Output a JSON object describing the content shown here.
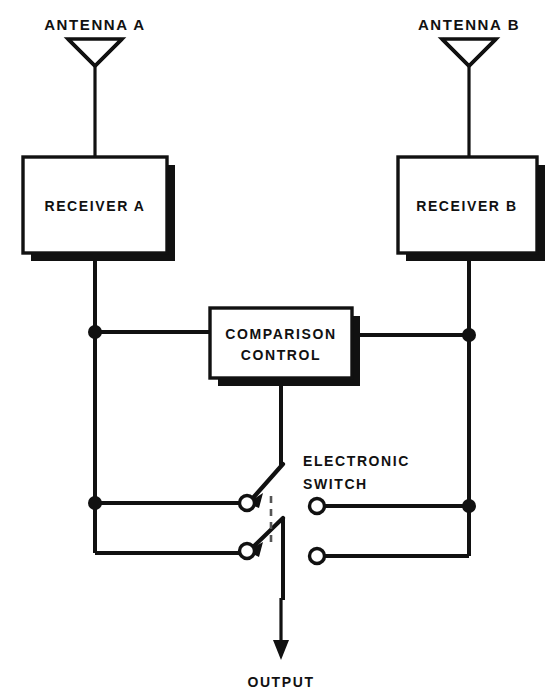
{
  "diagram": {
    "colors": {
      "ink": "#111111",
      "paper": "#ffffff",
      "dashed": "#555555"
    },
    "antennas": [
      {
        "id": "antenna-a",
        "label": "ANTENNA A",
        "x": 95,
        "label_x": 95,
        "label_y": 30
      },
      {
        "id": "antenna-b",
        "label": "ANTENNA B",
        "x": 469,
        "label_x": 469,
        "label_y": 30
      }
    ],
    "receivers": [
      {
        "id": "receiver-a",
        "label": "RECEIVER A",
        "x": 23,
        "y": 157,
        "w": 144,
        "h": 96
      },
      {
        "id": "receiver-b",
        "label": "RECEIVER B",
        "x": 398,
        "y": 157,
        "w": 139,
        "h": 96
      }
    ],
    "comparison_control": {
      "id": "comparison-control",
      "label_line1": "COMPARISON",
      "label_line2": "CONTROL",
      "x": 210,
      "y": 308,
      "w": 142,
      "h": 70
    },
    "electronic_switch": {
      "id": "electronic-switch",
      "label_line1": "ELECTRONIC",
      "label_line2": "SWITCH",
      "label_x": 303,
      "label_y1": 466,
      "label_y2": 489,
      "terminals": [
        {
          "id": "switch-terminal-left-upper",
          "cx": 247,
          "cy": 503,
          "r": 7.5
        },
        {
          "id": "switch-terminal-left-lower",
          "cx": 247,
          "cy": 551,
          "r": 7.5
        },
        {
          "id": "switch-terminal-right-upper",
          "cx": 317,
          "cy": 506,
          "r": 7.5
        },
        {
          "id": "switch-terminal-right-lower",
          "cx": 317,
          "cy": 556,
          "r": 7.5
        }
      ]
    },
    "output": {
      "id": "output",
      "label": "OUTPUT",
      "label_x": 281,
      "label_y": 684,
      "arrow_x": 281,
      "arrow_tip_y": 658
    },
    "junctions": [
      {
        "id": "junction-left-upper",
        "cx": 95,
        "cy": 332,
        "r": 7
      },
      {
        "id": "junction-left-lower",
        "cx": 95,
        "cy": 503,
        "r": 7
      },
      {
        "id": "junction-right-upper",
        "cx": 469,
        "cy": 335,
        "r": 7
      },
      {
        "id": "junction-right-lower",
        "cx": 469,
        "cy": 506,
        "r": 7
      }
    ]
  }
}
